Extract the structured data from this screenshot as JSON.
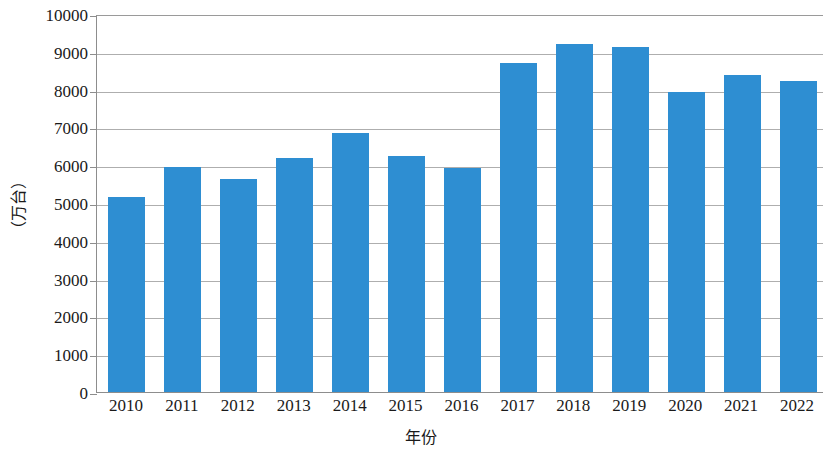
{
  "chart_data": {
    "type": "bar",
    "title": "",
    "subtitle": "",
    "xlabel": "年份",
    "ylabel": "（万台）",
    "categories": [
      "2010",
      "2011",
      "2012",
      "2013",
      "2014",
      "2015",
      "2016",
      "2017",
      "2018",
      "2019",
      "2020",
      "2021",
      "2022"
    ],
    "values": [
      5150,
      5960,
      5630,
      6180,
      6850,
      6250,
      5930,
      8700,
      9200,
      9120,
      7930,
      8380,
      8230
    ],
    "series": [
      {
        "name": "产量",
        "values": [
          5150,
          5960,
          5630,
          6180,
          6850,
          6250,
          5930,
          8700,
          9200,
          9120,
          7930,
          8380,
          8230
        ]
      }
    ],
    "ylim": [
      0,
      10000
    ],
    "ytick_labels": [
      "10000",
      "9000",
      "8000",
      "7000",
      "6000",
      "5000",
      "4000",
      "3000",
      "2000",
      "1000",
      "0"
    ],
    "ytick_values": [
      10000,
      9000,
      8000,
      7000,
      6000,
      5000,
      4000,
      3000,
      2000,
      1000,
      0
    ],
    "ytick_step": 1000,
    "grid": true,
    "grid_axis": "y",
    "legend": false,
    "legend_position": "none",
    "bar_color": "#2e8ed2",
    "grid_color": "#aeaeae",
    "axis_color": "#8d8d8d",
    "background_color": "#ffffff",
    "annotations": []
  }
}
